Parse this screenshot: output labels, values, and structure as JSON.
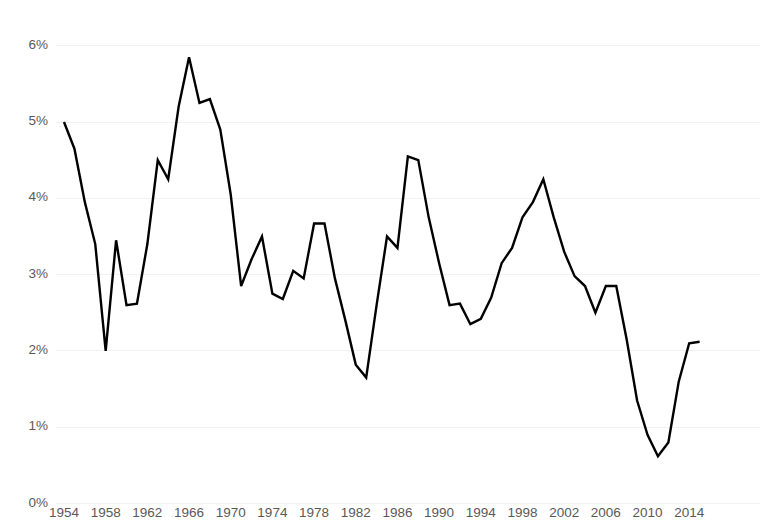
{
  "chart_data": {
    "type": "line",
    "title": "",
    "subtitle": "",
    "xlabel": "",
    "ylabel": "",
    "grid": true,
    "legend": false,
    "line_color": "#000000",
    "grid_color": "#f2f2f2",
    "text_color": "#595959",
    "background": "#ffffff",
    "xlim": [
      1954,
      2015
    ],
    "ylim": [
      0,
      6
    ],
    "y_tick_labels": [
      "0%",
      "1%",
      "2%",
      "3%",
      "4%",
      "5%",
      "6%"
    ],
    "y_ticks": [
      0,
      1,
      2,
      3,
      4,
      5,
      6
    ],
    "x_tick_labels": [
      "1954",
      "1958",
      "1962",
      "1966",
      "1970",
      "1974",
      "1978",
      "1982",
      "1986",
      "1990",
      "1994",
      "1998",
      "2002",
      "2006",
      "2010",
      "2014"
    ],
    "x_ticks": [
      1954,
      1958,
      1962,
      1966,
      1970,
      1974,
      1978,
      1982,
      1986,
      1990,
      1994,
      1998,
      2002,
      2006,
      2010,
      2014
    ],
    "x": [
      1954,
      1955,
      1956,
      1957,
      1958,
      1959,
      1960,
      1961,
      1962,
      1963,
      1964,
      1965,
      1966,
      1967,
      1968,
      1969,
      1970,
      1971,
      1972,
      1973,
      1974,
      1975,
      1976,
      1977,
      1978,
      1979,
      1980,
      1981,
      1982,
      1983,
      1984,
      1985,
      1986,
      1987,
      1988,
      1989,
      1990,
      1991,
      1992,
      1993,
      1994,
      1995,
      1996,
      1997,
      1998,
      1999,
      2000,
      2001,
      2002,
      2003,
      2004,
      2005,
      2006,
      2007,
      2008,
      2009,
      2010,
      2011,
      2012,
      2013,
      2014,
      2015
    ],
    "y": [
      5.0,
      4.65,
      3.95,
      3.4,
      2.0,
      3.45,
      2.6,
      2.62,
      3.4,
      4.5,
      4.25,
      5.2,
      5.85,
      5.25,
      5.3,
      4.9,
      4.05,
      2.85,
      3.2,
      3.5,
      2.75,
      2.68,
      3.05,
      2.95,
      3.67,
      3.67,
      2.95,
      2.4,
      1.82,
      1.65,
      2.6,
      3.5,
      3.35,
      4.55,
      4.5,
      3.75,
      3.15,
      2.6,
      2.62,
      2.35,
      2.42,
      2.7,
      3.15,
      3.35,
      3.75,
      3.95,
      4.25,
      3.75,
      3.3,
      2.98,
      2.85,
      2.5,
      2.85,
      2.85,
      2.15,
      1.35,
      0.9,
      0.62,
      0.8,
      1.6,
      2.1,
      2.12
    ],
    "series_name": "rate"
  }
}
